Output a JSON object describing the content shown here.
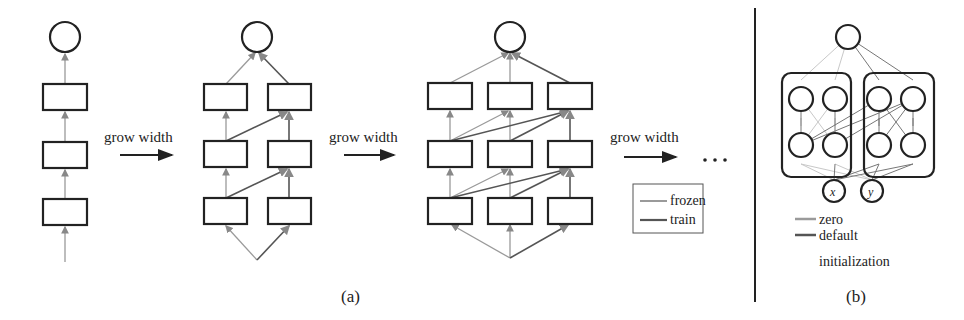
{
  "panel_a": {
    "caption": "(a)",
    "arrow_labels": [
      "grow width",
      "grow width",
      "grow width"
    ],
    "ellipsis": "…",
    "legend": {
      "items": [
        {
          "label": "frozen",
          "color": "#9a9a9a"
        },
        {
          "label": "train",
          "color": "#555555"
        }
      ]
    },
    "networks": [
      {
        "columns": 1,
        "layers": 3
      },
      {
        "columns": 2,
        "layers": 3
      },
      {
        "columns": 3,
        "layers": 3
      }
    ]
  },
  "panel_b": {
    "caption": "(b)",
    "inputs": [
      "x",
      "y"
    ],
    "legend": {
      "items": [
        {
          "label": "zero",
          "color": "#9a9a9a"
        },
        {
          "label": "default",
          "color": "#555555"
        }
      ],
      "continuation": "initialization"
    }
  },
  "colors": {
    "stroke": "#222222",
    "frozen": "#9a9a9a",
    "train": "#555555",
    "zero": "#c4c4c4"
  }
}
